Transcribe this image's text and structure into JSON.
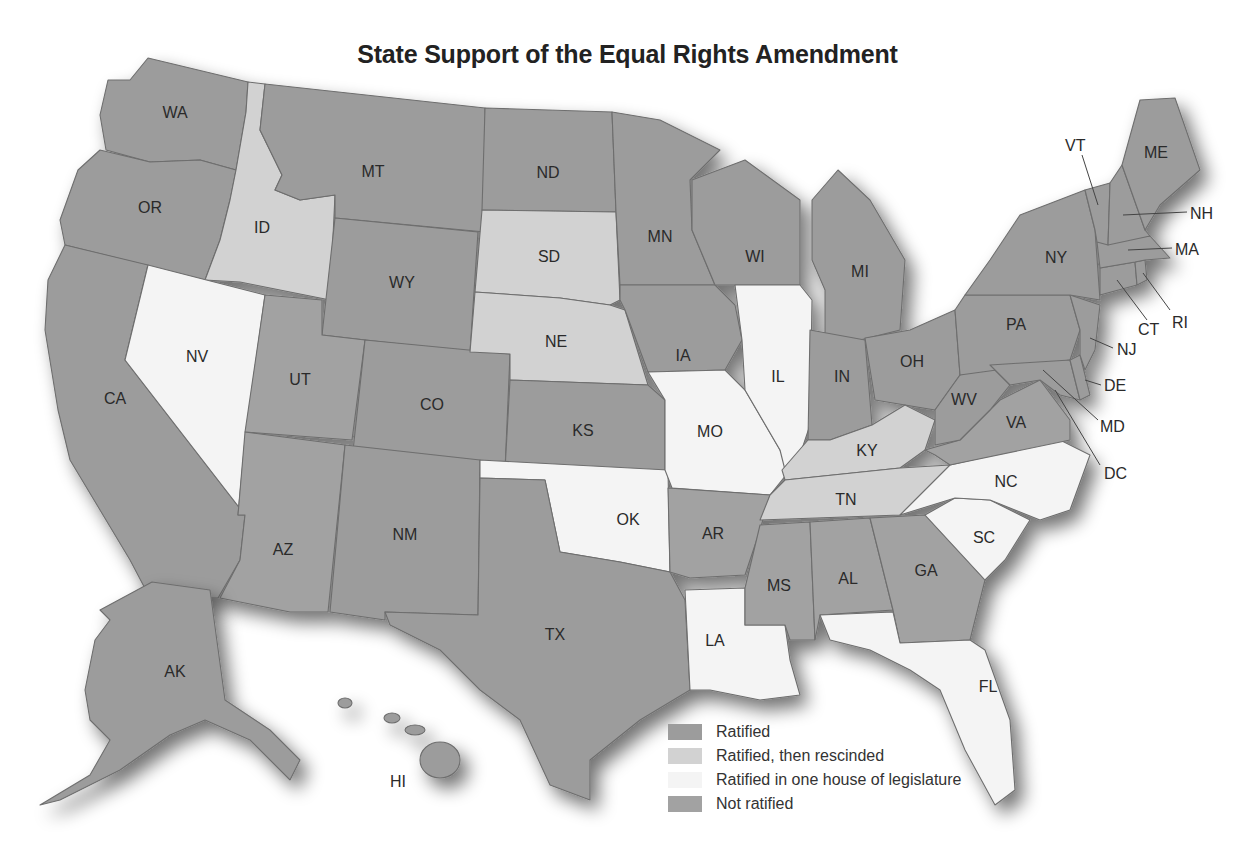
{
  "title": "State Support of the Equal Rights Amendment",
  "colors": {
    "ratified": "#9c9c9c",
    "rescinded": "#d2d2d2",
    "one_house": "#f4f4f4",
    "not_ratified": "#a2a2a2",
    "border": "#6e6e6e"
  },
  "legend": [
    {
      "key": "ratified",
      "label": "Ratified",
      "color": "#9c9c9c"
    },
    {
      "key": "rescinded",
      "label": "Ratified, then rescinded",
      "color": "#d2d2d2"
    },
    {
      "key": "one_house",
      "label": "Ratified in one house of legislature",
      "color": "#f4f4f4"
    },
    {
      "key": "not_ratified",
      "label": "Not ratified",
      "color": "#a2a2a2"
    }
  ],
  "states": {
    "WA": {
      "label": "WA",
      "status": "ratified"
    },
    "OR": {
      "label": "OR",
      "status": "ratified"
    },
    "CA": {
      "label": "CA",
      "status": "ratified"
    },
    "ID": {
      "label": "ID",
      "status": "rescinded"
    },
    "NV": {
      "label": "NV",
      "status": "one_house"
    },
    "MT": {
      "label": "MT",
      "status": "ratified"
    },
    "WY": {
      "label": "WY",
      "status": "ratified"
    },
    "UT": {
      "label": "UT",
      "status": "not_ratified"
    },
    "CO": {
      "label": "CO",
      "status": "ratified"
    },
    "AZ": {
      "label": "AZ",
      "status": "not_ratified"
    },
    "NM": {
      "label": "NM",
      "status": "ratified"
    },
    "ND": {
      "label": "ND",
      "status": "ratified"
    },
    "SD": {
      "label": "SD",
      "status": "rescinded"
    },
    "NE": {
      "label": "NE",
      "status": "rescinded"
    },
    "KS": {
      "label": "KS",
      "status": "ratified"
    },
    "OK": {
      "label": "OK",
      "status": "one_house"
    },
    "TX": {
      "label": "TX",
      "status": "ratified"
    },
    "MN": {
      "label": "MN",
      "status": "ratified"
    },
    "IA": {
      "label": "IA",
      "status": "ratified"
    },
    "MO": {
      "label": "MO",
      "status": "one_house"
    },
    "AR": {
      "label": "AR",
      "status": "not_ratified"
    },
    "LA": {
      "label": "LA",
      "status": "one_house"
    },
    "WI": {
      "label": "WI",
      "status": "ratified"
    },
    "IL": {
      "label": "IL",
      "status": "one_house"
    },
    "MI": {
      "label": "MI",
      "status": "ratified"
    },
    "IN": {
      "label": "IN",
      "status": "ratified"
    },
    "OH": {
      "label": "OH",
      "status": "ratified"
    },
    "KY": {
      "label": "KY",
      "status": "rescinded"
    },
    "TN": {
      "label": "TN",
      "status": "rescinded"
    },
    "MS": {
      "label": "MS",
      "status": "not_ratified"
    },
    "AL": {
      "label": "AL",
      "status": "not_ratified"
    },
    "GA": {
      "label": "GA",
      "status": "not_ratified"
    },
    "FL": {
      "label": "FL",
      "status": "one_house"
    },
    "SC": {
      "label": "SC",
      "status": "one_house"
    },
    "NC": {
      "label": "NC",
      "status": "one_house"
    },
    "VA": {
      "label": "VA",
      "status": "not_ratified"
    },
    "WV": {
      "label": "WV",
      "status": "ratified"
    },
    "PA": {
      "label": "PA",
      "status": "ratified"
    },
    "NY": {
      "label": "NY",
      "status": "ratified"
    },
    "VT": {
      "label": "VT",
      "status": "ratified"
    },
    "NH": {
      "label": "NH",
      "status": "ratified"
    },
    "ME": {
      "label": "ME",
      "status": "ratified"
    },
    "MA": {
      "label": "MA",
      "status": "ratified"
    },
    "RI": {
      "label": "RI",
      "status": "ratified"
    },
    "CT": {
      "label": "CT",
      "status": "ratified"
    },
    "NJ": {
      "label": "NJ",
      "status": "ratified"
    },
    "DE": {
      "label": "DE",
      "status": "ratified"
    },
    "MD": {
      "label": "MD",
      "status": "ratified"
    },
    "DC": {
      "label": "DC",
      "status": "ratified"
    },
    "AK": {
      "label": "AK",
      "status": "ratified"
    },
    "HI": {
      "label": "HI",
      "status": "ratified"
    }
  }
}
